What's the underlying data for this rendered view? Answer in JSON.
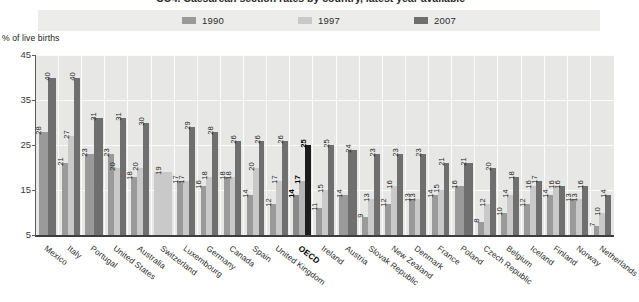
{
  "title": "CO4. Caesarean section rates by country, latest year available",
  "y_caption": "% of live births",
  "legend": [
    {
      "label": "1990",
      "color": "#9a9a9a"
    },
    {
      "label": "1997",
      "color": "#c9c9c9"
    },
    {
      "label": "2007",
      "color": "#6f6f6f"
    }
  ],
  "colors": {
    "series_1990": "#9a9a9a",
    "series_1997": "#c9c9c9",
    "series_2007": "#6f6f6f",
    "highlight_1990": "#8a8a8a",
    "highlight_1997": "#b5b5b5",
    "highlight_2007": "#1c1c1c",
    "plot_background": "#e7e7e6",
    "legend_background": "#ececeb",
    "gridline": "#fbfbfb",
    "axis": "#3d3d3d"
  },
  "y_ticks": [
    "5",
    "15",
    "25",
    "35",
    "45"
  ],
  "chart_data": {
    "type": "bar",
    "title": "CO4. Caesarean section rates by country, latest year available",
    "xlabel": "",
    "ylabel": "% of live births",
    "ylim": [
      5,
      45
    ],
    "grid": true,
    "legend_position": "top",
    "categories": [
      "Mexico",
      "Italy",
      "Portugal",
      "United States",
      "Australia",
      "Switzerland",
      "Luxembourg",
      "Germany",
      "Canada",
      "Spain",
      "United Kingdom",
      "OECD",
      "Ireland",
      "Austria",
      "Slovak Republic",
      "New Zealand",
      "Denmark",
      "France",
      "Poland",
      "Czech Republic",
      "Belgium",
      "Iceland",
      "Finland",
      "Norway",
      "Netherlands"
    ],
    "series": [
      {
        "name": "1990",
        "color": "#9a9a9a",
        "values": [
          28,
          21,
          23,
          23,
          18,
          null,
          17,
          16,
          18,
          14,
          12,
          14,
          11,
          14,
          9,
          12,
          13,
          14,
          16,
          8,
          10,
          12,
          14,
          13,
          7
        ]
      },
      {
        "name": "1997",
        "color": "#c9c9c9",
        "values": [
          null,
          27,
          null,
          20,
          20,
          19,
          17,
          18,
          18,
          20,
          17,
          17,
          15,
          null,
          13,
          16,
          13,
          15,
          null,
          12,
          14,
          16,
          16,
          13,
          10
        ]
      },
      {
        "name": "2007",
        "color": "#6f6f6f",
        "values": [
          40,
          40,
          31,
          31,
          30,
          null,
          29,
          28,
          26,
          26,
          26,
          25,
          25,
          24,
          23,
          23,
          23,
          21,
          21,
          20,
          18,
          17,
          16,
          16,
          14
        ]
      }
    ],
    "highlighted_category": "OECD"
  }
}
